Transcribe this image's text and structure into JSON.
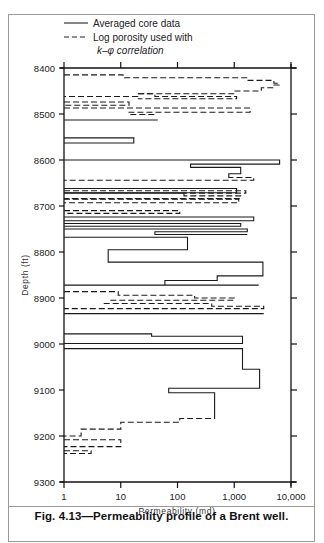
{
  "figure": {
    "caption": "Fig. 4.13—Permeability profile of a Brent well."
  },
  "legend": {
    "items": [
      {
        "label": "Averaged core data",
        "style": "solid"
      },
      {
        "label": "Log porosity used with",
        "style": "dashed"
      }
    ],
    "continuation": "k–φ correlation"
  },
  "chart_data": {
    "type": "line",
    "title": "Permeability profile of a Brent well",
    "xlabel": "Permeability (md)",
    "ylabel": "Depth (ft)",
    "xscale": "log",
    "xlim": [
      1,
      10000
    ],
    "ylim": [
      8400,
      9300
    ],
    "y_inverted": true,
    "grid": false,
    "legend_position": "top",
    "x_ticks": [
      1,
      10,
      100,
      1000,
      10000
    ],
    "x_tick_labels": [
      "1",
      "10",
      "100",
      "1,000",
      "10,000"
    ],
    "y_ticks": [
      8400,
      8500,
      8600,
      8700,
      8800,
      8900,
      9000,
      9100,
      9200,
      9300
    ],
    "y_tick_labels": [
      "8400",
      "8500",
      "8600",
      "8700",
      "8800",
      "8900",
      "9000",
      "9100",
      "9200",
      "9300"
    ],
    "series": [
      {
        "name": "Log porosity used with k-φ correlation",
        "style": "dashed",
        "segments": [
          [
            [
              8415,
              1
            ],
            [
              8415,
              11
            ],
            [
              8421,
              11
            ],
            [
              8421,
              1700
            ],
            [
              8421,
              1700
            ],
            [
              8427,
              1700
            ],
            [
              8427,
              5000
            ],
            [
              8433,
              5000
            ],
            [
              8433,
              6200
            ],
            [
              8437,
              6200
            ],
            [
              8437,
              4800
            ],
            [
              8443,
              4800
            ],
            [
              8443,
              3000
            ],
            [
              8450,
              3000
            ],
            [
              8450,
              1000
            ],
            [
              8456,
              1000
            ],
            [
              8456,
              20
            ],
            [
              8462,
              20
            ],
            [
              8462,
              1
            ]
          ],
          [
            [
              8456,
              20
            ],
            [
              8456,
              40
            ],
            [
              8462,
              40
            ],
            [
              8462,
              1100
            ],
            [
              8467,
              1100
            ],
            [
              8467,
              20
            ]
          ],
          [
            [
              8474,
              1
            ],
            [
              8474,
              14
            ],
            [
              8481,
              14
            ],
            [
              8481,
              1
            ],
            [
              8481,
              1
            ]
          ],
          [
            [
              8487,
              1
            ],
            [
              8487,
              1900
            ],
            [
              8496,
              1900
            ],
            [
              8496,
              14
            ],
            [
              8501,
              14
            ],
            [
              8501,
              40
            ]
          ]
        ]
      },
      {
        "name": "Averaged core data",
        "style": "solid",
        "segments": [
          [
            [
              8513,
              1
            ],
            [
              8513,
              45
            ],
            [
              8513,
              1
            ]
          ],
          [
            [
              8552,
              1
            ],
            [
              8552,
              17
            ],
            [
              8563,
              17
            ],
            [
              8563,
              1
            ]
          ],
          [
            [
              8600,
              1
            ],
            [
              8600,
              6300
            ],
            [
              8609,
              6300
            ],
            [
              8609,
              170
            ],
            [
              8616,
              170
            ],
            [
              8616,
              1300
            ],
            [
              8630,
              1300
            ],
            [
              8630,
              800
            ],
            [
              8635,
              800
            ]
          ],
          [
            [
              8662,
              1
            ],
            [
              8662,
              1100
            ],
            [
              8671,
              1100
            ],
            [
              8671,
              1
            ]
          ],
          [
            [
              8724,
              1
            ],
            [
              8724,
              2200
            ],
            [
              8732,
              2200
            ],
            [
              8732,
              1
            ]
          ],
          [
            [
              8738,
              1
            ],
            [
              8738,
              1300
            ],
            [
              8744,
              1300
            ],
            [
              8744,
              1
            ]
          ],
          [
            [
              8750,
              1
            ],
            [
              8750,
              1700
            ],
            [
              8756,
              1700
            ],
            [
              8756,
              40
            ],
            [
              8762,
              40
            ],
            [
              8762,
              1700
            ]
          ],
          [
            [
              8768,
              1
            ],
            [
              8768,
              150
            ],
            [
              8795,
              150
            ],
            [
              8795,
              6
            ],
            [
              8822,
              6
            ],
            [
              8822,
              3200
            ],
            [
              8852,
              3200
            ],
            [
              8852,
              500
            ],
            [
              8862,
              500
            ],
            [
              8862,
              60
            ],
            [
              8872,
              60
            ]
          ],
          [
            [
              8934,
              1
            ],
            [
              8934,
              3300
            ],
            [
              8934,
              1
            ]
          ],
          [
            [
              8978,
              1
            ],
            [
              8978,
              35
            ],
            [
              8983,
              35
            ],
            [
              8983,
              1400
            ],
            [
              8999,
              1400
            ],
            [
              8999,
              1
            ]
          ],
          [
            [
              9010,
              1
            ],
            [
              9010,
              1400
            ],
            [
              9055,
              1400
            ],
            [
              9055,
              2800
            ],
            [
              9096,
              2800
            ],
            [
              9096,
              70
            ],
            [
              9106,
              70
            ],
            [
              9106,
              450
            ],
            [
              9150,
              450
            ]
          ]
        ]
      },
      {
        "name": "Log porosity used with k-φ correlation (lower)",
        "style": "dashed",
        "segments": [
          [
            [
              8635,
              800
            ],
            [
              8638,
              800
            ],
            [
              8638,
              2200
            ],
            [
              8644,
              2200
            ],
            [
              8644,
              1
            ]
          ],
          [
            [
              8667,
              1
            ],
            [
              8667,
              1600
            ],
            [
              8672,
              1600
            ],
            [
              8672,
              1
            ],
            [
              8672,
              130
            ],
            [
              8678,
              130
            ],
            [
              8678,
              1300
            ],
            [
              8684,
              1300
            ],
            [
              8684,
              1
            ]
          ],
          [
            [
              8685,
              1
            ],
            [
              8685,
              1200
            ],
            [
              8693,
              1200
            ],
            [
              8693,
              1
            ]
          ],
          [
            [
              8710,
              1
            ],
            [
              8710,
              110
            ],
            [
              8716,
              110
            ],
            [
              8716,
              1
            ]
          ],
          [
            [
              8872,
              1
            ],
            [
              8872,
              2700
            ],
            [
              8872,
              1
            ]
          ],
          [
            [
              8886,
              1
            ],
            [
              8886,
              9
            ],
            [
              8894,
              9
            ],
            [
              8894,
              200
            ],
            [
              8900,
              200
            ],
            [
              8900,
              1000
            ],
            [
              8905,
              1000
            ],
            [
              8905,
              6
            ]
          ],
          [
            [
              8912,
              5
            ],
            [
              8912,
              400
            ],
            [
              8918,
              400
            ],
            [
              8918,
              3300
            ],
            [
              8923,
              3300
            ],
            [
              8923,
              1
            ]
          ],
          [
            [
              9150,
              450
            ],
            [
              9162,
              450
            ],
            [
              9162,
              110
            ],
            [
              9170,
              110
            ],
            [
              9170,
              10
            ],
            [
              9185,
              10
            ],
            [
              9185,
              2
            ],
            [
              9200,
              2
            ],
            [
              9200,
              1
            ]
          ],
          [
            [
              9208,
              1
            ],
            [
              9208,
              10
            ],
            [
              9223,
              10
            ],
            [
              9223,
              1
            ]
          ],
          [
            [
              9232,
              1
            ],
            [
              9232,
              3
            ],
            [
              9238,
              3
            ],
            [
              9238,
              1
            ]
          ]
        ]
      }
    ]
  }
}
